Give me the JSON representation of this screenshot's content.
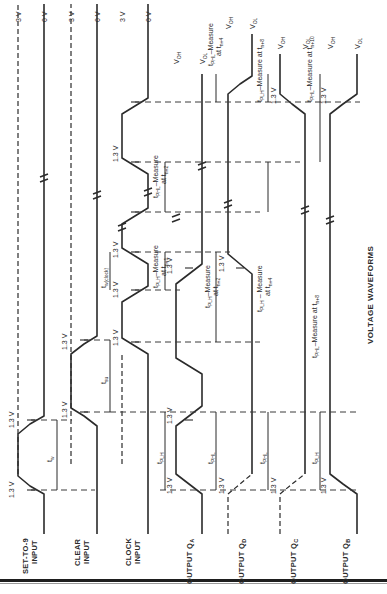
{
  "figure": {
    "title": "VOLTAGE WAVEFORMS",
    "orientation": "rotated 90° counter-clockwise",
    "threshold_label": "1.3 V"
  },
  "signals": [
    {
      "id": "set_to_9",
      "label_line1": "SET-TO-9",
      "label_line2": "INPUT",
      "high_label": "3 V",
      "low_label": "0 V",
      "high_ref_dashed": true
    },
    {
      "id": "clear",
      "label_line1": "CLEAR",
      "label_line2": "INPUT",
      "high_label": "3 V",
      "low_label": "0 V",
      "high_ref_dashed": true
    },
    {
      "id": "clock",
      "label_line1": "CLOCK",
      "label_line2": "INPUT",
      "high_label": "3 V",
      "low_label": "0 V",
      "high_ref_dashed": true
    },
    {
      "id": "qa",
      "label_line1": "OUTPUT Q",
      "sub": "A",
      "high_label": "V",
      "high_sub": "OH",
      "low_label": "V",
      "low_sub": "OL"
    },
    {
      "id": "qd",
      "label_line1": "OUTPUT Q",
      "sub": "D",
      "high_label": "V",
      "high_sub": "OH",
      "low_label": "V",
      "low_sub": "OL"
    },
    {
      "id": "qc",
      "label_line1": "OUTPUT Q",
      "sub": "C",
      "high_label": "V",
      "high_sub": "OH",
      "low_label": "V",
      "low_sub": "OL"
    },
    {
      "id": "qb",
      "label_line1": "OUTPUT Q",
      "sub": "B",
      "high_label": "V",
      "high_sub": "OH",
      "low_label": "V",
      "low_sub": "OL"
    }
  ],
  "annotations": {
    "tw_set": "t",
    "tw_sub": "w",
    "tsu": "t",
    "tsu_sub": "su",
    "tw_clock": "t",
    "tw_clock_sub": "w(clock)",
    "tplh": "t",
    "tplh_sub": "PLH",
    "tphl": "t",
    "tphl_sub": "PHL",
    "qa_plh_measure": {
      "prefix": "t",
      "sub": "PLH",
      "text": "–Measure",
      "at": "at t",
      "at_sub": "n+1"
    },
    "qa_phl_measure": {
      "prefix": "t",
      "sub": "PHL",
      "text": "–Measure",
      "at": "at t",
      "at_sub": "n+2"
    },
    "qd_plh_measure": {
      "prefix": "t",
      "sub": "PLH",
      "text": "–Measure",
      "at": "at t",
      "at_sub": "n+2"
    },
    "qd_phl_measure": {
      "prefix": "t",
      "sub": "PHL",
      "text": "–Measure",
      "at": "at t",
      "at_sub": "n+4"
    },
    "qc_plh_measure": {
      "prefix": "t",
      "sub": "PLH",
      "text": " – Measure",
      "at": "at t",
      "at_sub": "n+4"
    },
    "qc_phl_measure": {
      "prefix": "t",
      "sub": "PLH",
      "text": "–Measure at t",
      "at_sub": "n+8"
    },
    "qb_phl_measure": {
      "prefix": "t",
      "sub": "PHL",
      "text": "–Measure at t",
      "at_sub": "n+8"
    },
    "qb_phl_measure2": {
      "prefix": "t",
      "sub": "PHL",
      "text": "–Measure at t",
      "at_sub": "n+10"
    }
  },
  "colors": {
    "ink": "#2b2b2b",
    "background": "#ffffff"
  }
}
